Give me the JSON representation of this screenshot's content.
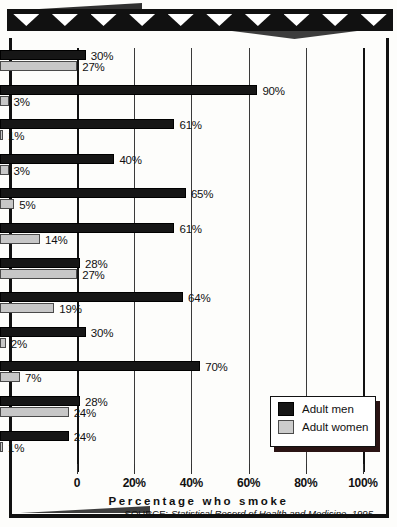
{
  "banner": {
    "triangle_count": 10
  },
  "chart_data": {
    "type": "bar",
    "orientation": "horizontal",
    "title": "",
    "xlabel": "Percentage who smoke",
    "ylabel": "",
    "xlim": [
      0,
      100
    ],
    "xticks": [
      "0",
      "20%",
      "40%",
      "60%",
      "80%",
      "100%"
    ],
    "xtick_values": [
      0,
      20,
      40,
      60,
      80,
      100
    ],
    "grid": true,
    "legend_position": "bottom-right",
    "categories": [
      "Australia",
      "Cambodia",
      "China",
      "India",
      "Indonesia",
      "Japan",
      "New\nZealand",
      "Philippines",
      "Singapore",
      "South\nKorea",
      "United\nStates",
      "Vietnam"
    ],
    "series": [
      {
        "name": "Adult men",
        "color": "#161616",
        "values": [
          30,
          90,
          61,
          40,
          65,
          61,
          28,
          64,
          30,
          70,
          28,
          24
        ],
        "labels": [
          "30%",
          "90%",
          "61%",
          "40%",
          "65%",
          "61%",
          "28%",
          "64%",
          "30%",
          "70%",
          "28%",
          "24%"
        ]
      },
      {
        "name": "Adult women",
        "color": "#c7c7c7",
        "values": [
          27,
          3,
          1,
          3,
          5,
          14,
          27,
          19,
          2,
          7,
          24,
          1
        ],
        "labels": [
          "27%",
          "3%",
          "1%",
          "3%",
          "5%",
          "14%",
          "27%",
          "19%",
          "2%",
          "7%",
          "24%",
          "1%"
        ]
      }
    ],
    "source": {
      "label": "SOURCE:",
      "text": " Statistical Record of Health and Medicine, 1995"
    }
  }
}
